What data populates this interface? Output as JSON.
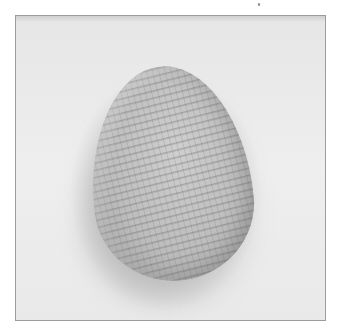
{
  "image": {
    "subject": "crocheted egg-shaped object",
    "description": "Photograph of a light gray crocheted egg on a pale background, framed by a thin gray border",
    "colors": {
      "background": "#ffffff",
      "frame_border": "#9c9c9c",
      "backdrop": "#ebebeb",
      "egg_body": "#c4c4c4",
      "stitch_shadow": "#5f5f5f"
    }
  }
}
